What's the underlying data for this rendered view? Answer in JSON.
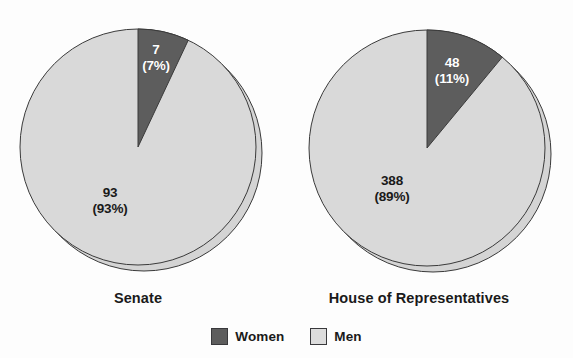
{
  "chart_data": [
    {
      "type": "pie",
      "title": "Senate",
      "categories": [
        "Women",
        "Men"
      ],
      "values": [
        7,
        93
      ],
      "percent_labels": [
        "(7%)",
        "(93%)"
      ],
      "value_labels": [
        "7",
        "93"
      ],
      "slice_colors": [
        "#5d5d5d",
        "#d9d9d9"
      ],
      "start_angle_deg": 0,
      "direction": "clockwise",
      "legend": "bottom",
      "xlabel": "",
      "ylabel": ""
    },
    {
      "type": "pie",
      "title": "House of Representatives",
      "categories": [
        "Women",
        "Men"
      ],
      "values": [
        48,
        388
      ],
      "percent_labels": [
        "(11%)",
        "(89%)"
      ],
      "value_labels": [
        "48",
        "388"
      ],
      "slice_colors": [
        "#5d5d5d",
        "#d9d9d9"
      ],
      "start_angle_deg": 0,
      "direction": "clockwise",
      "legend": "bottom",
      "xlabel": "",
      "ylabel": ""
    }
  ],
  "charts": {
    "senate": {
      "title": "Senate",
      "women_value": "7",
      "women_percent": "(7%)",
      "men_value": "93",
      "men_percent": "(93%)"
    },
    "house": {
      "title": "House of Representatives",
      "women_value": "48",
      "women_percent": "(11%)",
      "men_value": "388",
      "men_percent": "(89%)"
    }
  },
  "legend": {
    "items": [
      {
        "label": "Women",
        "color": "#5d5d5d"
      },
      {
        "label": "Men",
        "color": "#d9d9d9"
      }
    ]
  },
  "artifact": {
    "text": ""
  }
}
